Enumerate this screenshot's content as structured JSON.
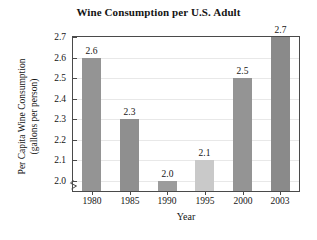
{
  "chart_data": {
    "type": "bar",
    "title": "Wine Consumption per U.S. Adult",
    "xlabel": "Year",
    "ylabel": "Per Capita Wine Consumption",
    "ylabel_line2": "(gallons per person)",
    "categories": [
      "1980",
      "1985",
      "1990",
      "1995",
      "2000",
      "2003"
    ],
    "values": [
      2.6,
      2.3,
      2.0,
      2.1,
      2.5,
      2.7
    ],
    "data_labels": [
      "2.6",
      "2.3",
      "2.0",
      "2.1",
      "2.5",
      "2.7"
    ],
    "ylim": [
      1.95,
      2.7
    ],
    "yticks": [
      2.0,
      2.1,
      2.2,
      2.3,
      2.4,
      2.5,
      2.6,
      2.7
    ],
    "ytick_labels": [
      "2.0",
      "2.1",
      "2.2",
      "2.3",
      "2.4",
      "2.5",
      "2.6",
      "2.7"
    ],
    "axis_break": true,
    "axis_break_symbol": "break-mark",
    "grid": true,
    "grid_axis": "y",
    "legend": null,
    "bar_colors": [
      "#949494",
      "#8f8f8f",
      "#9c9c9c",
      "#c9c9c9",
      "#949494",
      "#8a8a8a"
    ],
    "colors": {
      "bar_default": "#949494",
      "bar_highlight": "#c9c9c9",
      "axis": "#4a4a4a",
      "grid": "#e8e8e8",
      "text": "#141414",
      "background": "#ffffff"
    }
  }
}
